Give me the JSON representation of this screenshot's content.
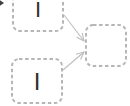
{
  "canvas": {
    "width": 130,
    "height": 106,
    "background": "#ffffff"
  },
  "style": {
    "node_border_color": "#b6b6b6",
    "node_fill": "#ffffff",
    "node_border_radius": 7,
    "node_dash": "3.5,2.6",
    "node_stroke_width": 2,
    "edge_color": "#bdbdbd",
    "edge_stroke_width": 1.1,
    "label_color": "#2f2f2f",
    "corner_arrow_color": "#3f3f3f"
  },
  "nodes": [
    {
      "id": "node-top-left",
      "label": "I",
      "x": 13,
      "y": -13,
      "width": 50,
      "height": 44,
      "font_size": 22
    },
    {
      "id": "node-bottom-left",
      "label": "I",
      "x": 12,
      "y": 59,
      "width": 50,
      "height": 44,
      "font_size": 24
    },
    {
      "id": "node-right",
      "label": "",
      "x": 86,
      "y": 25,
      "width": 40,
      "height": 41,
      "font_size": 22
    }
  ],
  "edges": [
    {
      "id": "edge-top-to-right",
      "from": "node-top-left",
      "to": "node-right",
      "x1": 64,
      "y1": 15,
      "x2": 84,
      "y2": 41
    },
    {
      "id": "edge-bottom-to-right",
      "from": "node-bottom-left",
      "to": "node-right",
      "x1": 63,
      "y1": 70,
      "x2": 84,
      "y2": 52
    }
  ],
  "decorations": [
    {
      "id": "clipped-arrowhead",
      "points": "-3,-2 4,3 -3,8"
    }
  ]
}
